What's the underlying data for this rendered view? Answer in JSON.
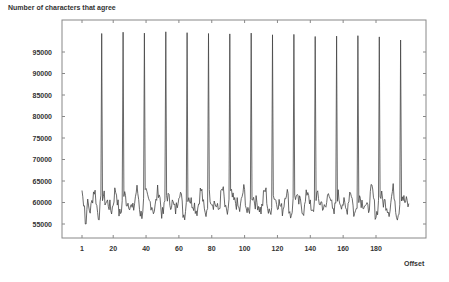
{
  "chart_data": {
    "type": "line",
    "title": "Number of characters that agree",
    "xlabel": "Offset",
    "ylabel": "Number of characters that agree",
    "xlim": [
      1,
      200
    ],
    "ylim": [
      52000,
      102000
    ],
    "x_ticks": [
      1,
      20,
      40,
      60,
      80,
      100,
      120,
      140,
      160,
      180
    ],
    "y_ticks": [
      55000,
      60000,
      65000,
      70000,
      75000,
      80000,
      85000,
      90000,
      95000
    ],
    "grid": false,
    "legend": "none",
    "series": [
      {
        "name": "agreement",
        "peak_offsets": [
          13,
          26,
          39,
          52,
          65,
          78,
          91,
          104,
          117,
          130,
          143,
          156,
          169,
          182,
          195
        ],
        "peak_values": [
          99300,
          99600,
          99400,
          99700,
          99500,
          99300,
          99200,
          99400,
          99000,
          99100,
          98600,
          98700,
          98800,
          98500,
          97800
        ],
        "baseline_mean": 60000,
        "baseline_range": [
          55000,
          63500
        ],
        "x_start": 1,
        "x_end": 200
      }
    ]
  }
}
